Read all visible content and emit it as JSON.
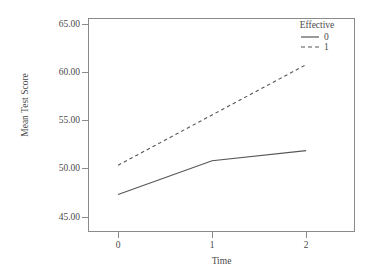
{
  "chart_data": {
    "type": "line",
    "title": "",
    "xlabel": "Time",
    "ylabel": "Mean Test Score",
    "x": [
      0,
      1,
      2
    ],
    "xtick_labels": [
      "0",
      "1",
      "2"
    ],
    "ytick_labels": [
      "45.00",
      "50.00",
      "55.00",
      "60.00",
      "65.00"
    ],
    "ytick_values": [
      45.0,
      50.0,
      55.0,
      60.0,
      65.0
    ],
    "xlim": [
      -0.32,
      2.52
    ],
    "ylim": [
      42.8,
      66.2
    ],
    "grid": false,
    "legend_position": "top-right-inside",
    "legend_title": "Effective",
    "series": [
      {
        "name": "0",
        "style": "solid",
        "color": "#555555",
        "values": [
          46.9,
          50.6,
          51.7
        ]
      },
      {
        "name": "1",
        "style": "dashed",
        "color": "#555555",
        "values": [
          50.1,
          55.6,
          61.1
        ]
      }
    ]
  },
  "axes": {
    "x_title": "Time",
    "y_title": "Mean Test Score",
    "x_ticks": [
      "0",
      "1",
      "2"
    ],
    "y_ticks": [
      "65.00",
      "60.00",
      "55.00",
      "50.00",
      "45.00"
    ]
  },
  "legend": {
    "title": "Effective",
    "entries": [
      {
        "label": "0",
        "style": "solid"
      },
      {
        "label": "1",
        "style": "dashed"
      }
    ]
  },
  "colors": {
    "line": "#555555",
    "frame": "#8a8a8a",
    "text": "#4a4a4a",
    "background": "#ffffff"
  }
}
